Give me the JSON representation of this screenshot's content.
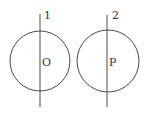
{
  "diagram": {
    "type": "geometry",
    "stroke_color": "#4a4a4a",
    "text_color": "#333333",
    "figures": [
      {
        "line_label": "1",
        "center_label": "O",
        "circle": {
          "cx": 40,
          "cy": 61,
          "r": 30
        },
        "line": {
          "x": 40,
          "y1": 14,
          "y2": 107
        },
        "line_label_pos": {
          "x": 44,
          "y": 19
        },
        "center_label_pos": {
          "x": 42,
          "y": 66
        }
      },
      {
        "line_label": "2",
        "center_label": "P",
        "circle": {
          "cx": 108,
          "cy": 61,
          "r": 31
        },
        "line": {
          "x": 107,
          "y1": 15,
          "y2": 107
        },
        "line_label_pos": {
          "x": 112,
          "y": 19
        },
        "center_label_pos": {
          "x": 109,
          "y": 66
        }
      }
    ]
  }
}
